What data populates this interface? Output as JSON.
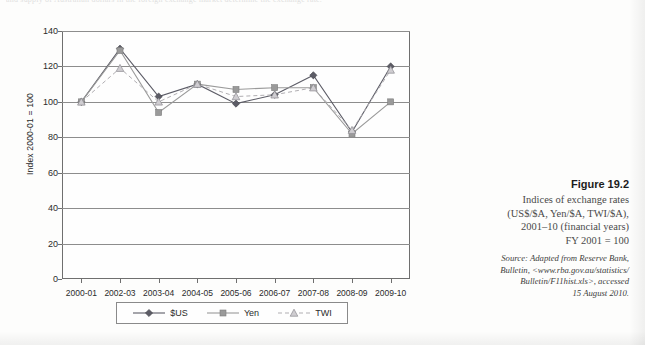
{
  "page": {
    "top_text_sliver": "and supply of Australian dollars in the foreign exchange market determine the exchange rate."
  },
  "figure": {
    "number": "Figure 19.2",
    "caption_lines": [
      "Indices of exchange rates",
      "(US$/$A, Yen/$A, TWI/$A),",
      "2001–10 (financial years)",
      "FY 2001  = 100"
    ],
    "source_lines": [
      "Source: Adapted from Reserve Bank,",
      "Bulletin, <www.rba.gov.au/statistics/",
      "Bulletin/F11hist.xls>, accessed",
      "15 August 2010."
    ]
  },
  "chart_data": {
    "type": "line",
    "title": "",
    "xlabel": "",
    "ylabel": "Index 2000-01 = 100",
    "ylim": [
      0,
      140
    ],
    "yticks": [
      0,
      20,
      40,
      60,
      80,
      100,
      120,
      140
    ],
    "grid": "horizontal",
    "legend_position": "bottom",
    "categories": [
      "2000-01",
      "2002-03",
      "2003-04",
      "2004-05",
      "2005-06",
      "2006-07",
      "2007-08",
      "2008-09",
      "2009-10"
    ],
    "series": [
      {
        "name": "$US",
        "marker": "diamond",
        "linestyle": "solid",
        "color": "#5c5c66",
        "values": [
          100,
          130,
          103,
          110,
          99,
          104,
          115,
          83,
          120
        ]
      },
      {
        "name": "Yen",
        "marker": "square",
        "linestyle": "solid",
        "color": "#9a9a9a",
        "values": [
          100,
          129,
          94,
          110,
          107,
          108,
          108,
          82,
          100
        ]
      },
      {
        "name": "TWI",
        "marker": "triangle",
        "linestyle": "dashed",
        "color": "#b0aeb2",
        "values": [
          100,
          119,
          100,
          110,
          103,
          104,
          108,
          84,
          118
        ]
      }
    ]
  }
}
